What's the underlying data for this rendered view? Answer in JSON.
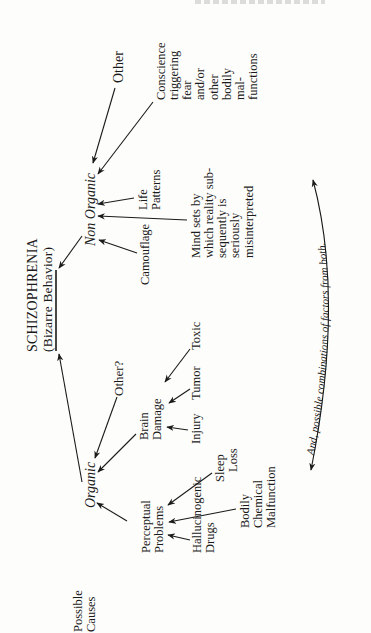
{
  "diagram": {
    "title": "SCHIZOPHRENIA",
    "subtitle": "(Bizarre Behavior)",
    "left_label": [
      "Possible",
      "Causes"
    ],
    "branches": {
      "organic": {
        "label": "Organic",
        "children": {
          "perceptual_problems": {
            "label": [
              "Perceptual",
              "Problems"
            ],
            "causes": [
              [
                "Hallucinogenic",
                "Drugs"
              ],
              [
                "Sleep",
                "Loss"
              ],
              [
                "Bodily",
                "Chemical",
                "Malfunction"
              ]
            ]
          },
          "brain_damage": {
            "label": [
              "Brain",
              "Damage"
            ],
            "causes": [
              "Injury",
              "Tumor",
              "Toxic"
            ]
          },
          "other": "Other?"
        }
      },
      "non_organic": {
        "label": "Non Organic",
        "children": {
          "camouflage": "Camouflage",
          "mind_sets": [
            "Mind sets by",
            "which reality sub-",
            "sequently is",
            "seriously",
            "misinterpreted"
          ],
          "life_patterns": [
            "Life",
            "Patterns"
          ],
          "conscience": [
            "Conscience",
            "triggering",
            "fear",
            "and/or",
            "other",
            "bodily",
            "mal-",
            "functions"
          ],
          "other": "Other"
        }
      }
    },
    "curved_arrow_text": "And, possible combinations of factors from both."
  }
}
